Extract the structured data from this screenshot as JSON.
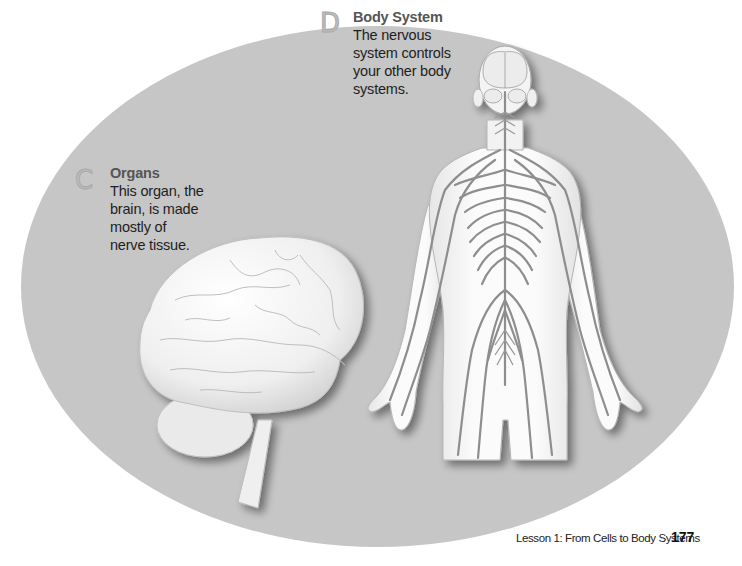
{
  "page": {
    "background": "#ffffff",
    "panel_color": "#c6c6c6"
  },
  "callouts": {
    "body_system": {
      "letter": "D",
      "title": "Body System",
      "text_lines": [
        "The nervous",
        "system controls",
        "your other body",
        "systems."
      ]
    },
    "organs": {
      "letter": "C",
      "title": "Organs",
      "text_lines": [
        "This organ, the",
        "brain, is made",
        "mostly of",
        "nerve tissue."
      ]
    }
  },
  "illustrations": {
    "brain": "brain-illustration",
    "body": "nervous-system-illustration"
  },
  "footer": {
    "lesson": "Lesson 1: From Cells to Body Systems",
    "page_number": "177"
  }
}
